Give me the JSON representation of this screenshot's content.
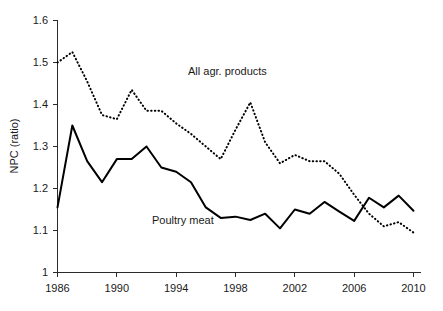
{
  "chart_data": {
    "type": "line",
    "title": "",
    "xlabel": "",
    "ylabel": "NPC  (ratio)",
    "xlim": [
      1986,
      2010
    ],
    "ylim": [
      1,
      1.6
    ],
    "grid": false,
    "legend_position": "inline-annotations",
    "x": [
      1986,
      1987,
      1988,
      1989,
      1990,
      1991,
      1992,
      1993,
      1994,
      1995,
      1996,
      1997,
      1998,
      1999,
      2000,
      2001,
      2002,
      2003,
      2004,
      2005,
      2006,
      2007,
      2008,
      2009,
      2010
    ],
    "y_ticks": [
      1,
      1.1,
      1.2,
      1.3,
      1.4,
      1.5,
      1.6
    ],
    "y_tick_labels": [
      "1",
      "1.1",
      "1.2",
      "1.3",
      "1.4",
      "1.5",
      "1.6"
    ],
    "x_ticks": [
      1986,
      1990,
      1994,
      1998,
      2002,
      2006,
      2010
    ],
    "x_tick_labels": [
      "1986",
      "1990",
      "1994",
      "1998",
      "2002",
      "2006",
      "2010"
    ],
    "series": [
      {
        "name": "All agr. products",
        "style": "dotted",
        "color": "#000000",
        "annotation": "All agr. products",
        "values": [
          1.5,
          1.525,
          1.455,
          1.375,
          1.365,
          1.435,
          1.385,
          1.385,
          1.355,
          1.33,
          1.3,
          1.27,
          1.34,
          1.405,
          1.31,
          1.26,
          1.28,
          1.265,
          1.265,
          1.235,
          1.185,
          1.14,
          1.11,
          1.12,
          1.095
        ]
      },
      {
        "name": "Poultry meat",
        "style": "solid",
        "color": "#000000",
        "annotation": "Poultry meat",
        "values": [
          1.155,
          1.35,
          1.265,
          1.215,
          1.27,
          1.27,
          1.3,
          1.25,
          1.24,
          1.215,
          1.155,
          1.13,
          1.133,
          1.125,
          1.14,
          1.105,
          1.15,
          1.14,
          1.168,
          1.145,
          1.123,
          1.178,
          1.155,
          1.183,
          1.147
        ]
      }
    ]
  },
  "annotations": {
    "all_agr_products": "All agr. products",
    "poultry_meat": "Poultry meat"
  },
  "axis": {
    "y_title": "NPC  (ratio)"
  }
}
